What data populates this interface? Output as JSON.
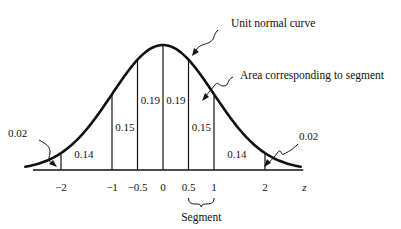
{
  "chart_data": {
    "type": "area",
    "title": "",
    "xlabel": "z",
    "ylabel": "",
    "distribution": "standard normal",
    "xlim": [
      -2.7,
      2.7
    ],
    "x_ticks": [
      {
        "value": -2,
        "label": "−2"
      },
      {
        "value": -1,
        "label": "−1"
      },
      {
        "value": -0.5,
        "label": "−0.5"
      },
      {
        "value": 0,
        "label": "0"
      },
      {
        "value": 0.5,
        "label": "0.5"
      },
      {
        "value": 1,
        "label": "1"
      },
      {
        "value": 2,
        "label": "2"
      }
    ],
    "boundaries": [
      -2,
      -1,
      -0.5,
      0,
      0.5,
      1,
      2
    ],
    "segments": [
      {
        "from": null,
        "to": -2,
        "area": 0.02,
        "label": "0.02",
        "callout": true
      },
      {
        "from": -2,
        "to": -1,
        "area": 0.14,
        "label": "0.14"
      },
      {
        "from": -1,
        "to": -0.5,
        "area": 0.15,
        "label": "0.15"
      },
      {
        "from": -0.5,
        "to": 0,
        "area": 0.19,
        "label": "0.19"
      },
      {
        "from": 0,
        "to": 0.5,
        "area": 0.19,
        "label": "0.19"
      },
      {
        "from": 0.5,
        "to": 1,
        "area": 0.15,
        "label": "0.15"
      },
      {
        "from": 1,
        "to": 2,
        "area": 0.14,
        "label": "0.14"
      },
      {
        "from": 2,
        "to": null,
        "area": 0.02,
        "label": "0.02",
        "callout": true
      }
    ],
    "annotations": [
      {
        "text": "Unit normal curve",
        "points_to": "curve peak"
      },
      {
        "text": "Area corresponding to segment",
        "points_to": "segment 0.5 to 1"
      },
      {
        "text": "Segment",
        "brace_from": 0.5,
        "brace_to": 1
      }
    ],
    "grid": false,
    "legend": "none"
  }
}
